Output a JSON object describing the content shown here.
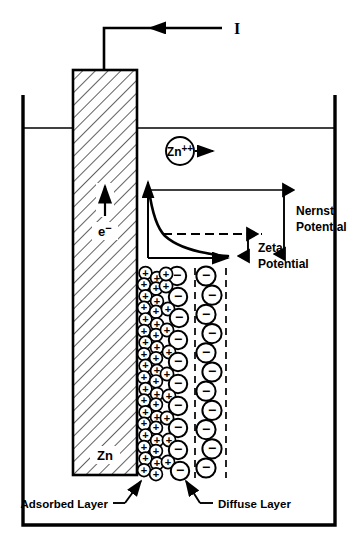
{
  "diagram": {
    "title_visible": false,
    "labels": {
      "current": "I",
      "electron": "e",
      "electron_charge": "−",
      "metal": "Zn",
      "ion": "Zn",
      "ion_charge": "++",
      "nernst_line1": "Nernst",
      "nernst_line2": "Potential",
      "zeta_line1": "Zeta",
      "zeta_line2": "Potential",
      "adsorbed_layer": "Adsorbed Layer",
      "diffuse_layer": "Diffuse Layer"
    },
    "symbols": {
      "positive_ion": "+",
      "negative_ion": "−"
    },
    "colors": {
      "ink": "#000000",
      "background": "#ffffff",
      "hatch": "#000000"
    },
    "icon_names": {
      "current_arrow": "current-arrow-icon",
      "electron_arrow": "electron-arrow-icon",
      "ion_arrow": "ion-migration-arrow-icon",
      "nernst_arrow": "nernst-measure-arrow-icon",
      "zeta_arrow": "zeta-measure-arrow-icon"
    },
    "chart_data": {
      "type": "line",
      "title": "Potential decay across the electrical double layer",
      "xlabel": "Distance from electrode surface",
      "ylabel": "Potential",
      "x": [
        0,
        0.06,
        0.12,
        0.18,
        0.24,
        0.3,
        0.4,
        0.5,
        0.65,
        0.8,
        1.0
      ],
      "y": [
        1.0,
        0.72,
        0.52,
        0.38,
        0.3,
        0.25,
        0.18,
        0.13,
        0.08,
        0.05,
        0.03
      ],
      "annotations": [
        {
          "name": "nernst-potential",
          "label": "Nernst Potential",
          "value": 1.0,
          "from": 0.0,
          "to": 1.0
        },
        {
          "name": "zeta-potential",
          "label": "Zeta Potential",
          "value": 0.3,
          "from": 0.0,
          "to": 0.3
        }
      ],
      "grid": false,
      "legend": "none"
    },
    "ion_field": {
      "adsorbed_positive_count": 44,
      "diffuse_positive_count": 14,
      "diffuse_negative_count": 28,
      "zone_boundaries": [
        195,
        226
      ]
    }
  }
}
